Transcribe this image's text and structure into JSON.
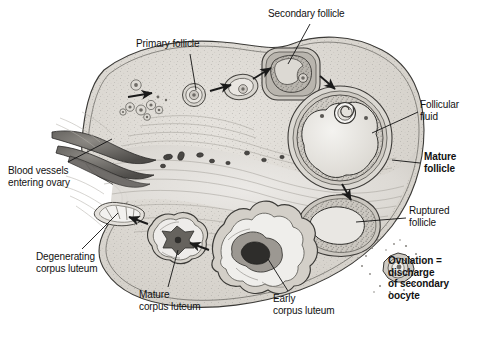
{
  "figure": {
    "style": "grayscale anatomical line illustration with stipple shading",
    "width": 478,
    "height": 345,
    "background": "#ffffff",
    "ink": "#111111"
  },
  "labels": [
    {
      "id": "secondary-follicle",
      "text": "Secondary follicle",
      "bold": false,
      "x": 268,
      "y": 10,
      "align": "left",
      "leader": {
        "from": [
          310,
          24
        ],
        "to": [
          288,
          62
        ]
      }
    },
    {
      "id": "primary-follicle",
      "text": "Primary follicle",
      "bold": false,
      "x": 136,
      "y": 40,
      "align": "left",
      "leader": {
        "from": [
          190,
          54
        ],
        "to": [
          196,
          92
        ]
      }
    },
    {
      "id": "follicular-fluid",
      "text": "Follicular\nfluid",
      "bold": false,
      "x": 420,
      "y": 100,
      "align": "left",
      "leader": {
        "from": [
          418,
          112
        ],
        "to": [
          376,
          132
        ]
      }
    },
    {
      "id": "mature-follicle",
      "text": "Mature\nfollicle",
      "bold": true,
      "x": 424,
      "y": 152,
      "align": "left",
      "leader": {
        "from": [
          420,
          164
        ],
        "to": [
          394,
          162
        ]
      }
    },
    {
      "id": "ruptured-follicle",
      "text": "Ruptured\nfollicle",
      "bold": false,
      "x": 408,
      "y": 206,
      "align": "left",
      "leader": {
        "from": [
          406,
          218
        ],
        "to": [
          358,
          222
        ]
      }
    },
    {
      "id": "ovulation-note",
      "text": "Ovulation =\ndischarge\nof secondary\noocyte",
      "bold": true,
      "x": 388,
      "y": 256,
      "align": "left",
      "leader": null
    },
    {
      "id": "blood-vessels",
      "text": "Blood vessels\nentering ovary",
      "bold": false,
      "x": 8,
      "y": 166,
      "align": "left",
      "leader": {
        "from": [
          66,
          163
        ],
        "to": [
          112,
          140
        ]
      }
    },
    {
      "id": "degenerating-corpus-luteum",
      "text": "Degenerating\ncorpus luteum",
      "bold": false,
      "x": 36,
      "y": 252,
      "align": "left",
      "leader": {
        "from": [
          80,
          250
        ],
        "to": [
          120,
          214
        ]
      }
    },
    {
      "id": "mature-corpus-luteum",
      "text": "Mature\ncorpus luteum",
      "bold": false,
      "x": 138,
      "y": 290,
      "align": "left",
      "leader": {
        "from": [
          166,
          288
        ],
        "to": [
          176,
          250
        ]
      }
    },
    {
      "id": "early-corpus-luteum",
      "text": "Early\ncorpus luteum",
      "bold": false,
      "x": 272,
      "y": 294,
      "align": "left",
      "leader": {
        "from": [
          286,
          292
        ],
        "to": [
          268,
          258
        ]
      }
    }
  ],
  "structures": [
    {
      "id": "ovary-outline",
      "name": "ovary-cortex-outline"
    },
    {
      "id": "germinal-epithelium",
      "name": "germinal-epithelium-border"
    },
    {
      "id": "primordial-follicles",
      "name": "primordial-follicle-cluster",
      "count": 8
    },
    {
      "id": "primary-follicle",
      "name": "primary-follicle"
    },
    {
      "id": "growing-follicle",
      "name": "growing-follicle"
    },
    {
      "id": "secondary-follicle",
      "name": "secondary-follicle"
    },
    {
      "id": "mature-follicle",
      "name": "mature-graafian-follicle"
    },
    {
      "id": "ruptured-follicle",
      "name": "ruptured-follicle"
    },
    {
      "id": "ovulated-oocyte",
      "name": "secondary-oocyte"
    },
    {
      "id": "early-corpus-luteum",
      "name": "early-corpus-luteum"
    },
    {
      "id": "mature-corpus-luteum",
      "name": "mature-corpus-luteum"
    },
    {
      "id": "degenerating-corpus-luteum",
      "name": "corpus-albicans"
    },
    {
      "id": "blood-vessels",
      "name": "hilum-blood-vessels"
    },
    {
      "id": "medulla",
      "name": "ovarian-medulla-stroma"
    }
  ],
  "cycle_arrows": [
    {
      "id": "arrow-1",
      "from": [
        130,
        96
      ],
      "to": [
        152,
        92
      ]
    },
    {
      "id": "arrow-2",
      "from": [
        210,
        90
      ],
      "to": [
        232,
        84
      ]
    },
    {
      "id": "arrow-3",
      "from": [
        254,
        80
      ],
      "to": [
        272,
        70
      ]
    },
    {
      "id": "arrow-4",
      "from": [
        322,
        78
      ],
      "to": [
        336,
        90
      ]
    },
    {
      "id": "arrow-5",
      "from": [
        344,
        186
      ],
      "to": [
        352,
        200
      ]
    },
    {
      "id": "arrow-6",
      "from": [
        206,
        248
      ],
      "to": [
        190,
        242
      ]
    },
    {
      "id": "arrow-7",
      "from": [
        146,
        222
      ],
      "to": [
        130,
        216
      ]
    }
  ]
}
